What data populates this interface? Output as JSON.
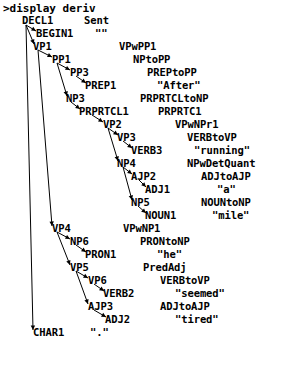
{
  "terminal": {
    "prompt_line": ">display deriv"
  },
  "derivation": {
    "header": {
      "node": "DECL1",
      "rule": "Sent"
    },
    "rows": [
      {
        "node": "DECL1",
        "node_x": 22,
        "rule": "Sent",
        "rule_x": 84,
        "y": 20,
        "depth": 0
      },
      {
        "node": "BEGIN1",
        "node_x": 36,
        "rule": "\"\"",
        "rule_x": 95,
        "y": 33,
        "depth": 1
      },
      {
        "node": "VP1",
        "node_x": 33,
        "rule": "VPwPP1",
        "rule_x": 119,
        "y": 46,
        "depth": 1
      },
      {
        "node": "PP1",
        "node_x": 52,
        "rule": "NPtoPP",
        "rule_x": 133,
        "y": 59,
        "depth": 2
      },
      {
        "node": "PP3",
        "node_x": 70,
        "rule": "PREPtoPP",
        "rule_x": 147,
        "y": 72,
        "depth": 3
      },
      {
        "node": "PREP1",
        "node_x": 85,
        "rule": "\"After\"",
        "rule_x": 157,
        "y": 85,
        "depth": 4
      },
      {
        "node": "NP3",
        "node_x": 66,
        "rule": "PRPRTCLtoNP",
        "rule_x": 140,
        "y": 98,
        "depth": 3
      },
      {
        "node": "PRPRTCL1",
        "node_x": 79,
        "rule": "PRPRTC1",
        "rule_x": 158,
        "y": 111,
        "depth": 4
      },
      {
        "node": "VP2",
        "node_x": 103,
        "rule": "VPwNPr1",
        "rule_x": 175,
        "y": 124,
        "depth": 5
      },
      {
        "node": "VP3",
        "node_x": 117,
        "rule": "VERBtoVP",
        "rule_x": 187,
        "y": 137,
        "depth": 6
      },
      {
        "node": "VERB3",
        "node_x": 131,
        "rule": "\"running\"",
        "rule_x": 194,
        "y": 150,
        "depth": 7
      },
      {
        "node": "NP4",
        "node_x": 117,
        "rule": "NPwDetQuant",
        "rule_x": 187,
        "y": 163,
        "depth": 6
      },
      {
        "node": "AJP2",
        "node_x": 131,
        "rule": "ADJtoAJP",
        "rule_x": 201,
        "y": 176,
        "depth": 7
      },
      {
        "node": "ADJ1",
        "node_x": 145,
        "rule": "\"a\"",
        "rule_x": 217,
        "y": 189,
        "depth": 8
      },
      {
        "node": "NP5",
        "node_x": 131,
        "rule": "NOUNtoNP",
        "rule_x": 201,
        "y": 202,
        "depth": 7
      },
      {
        "node": "NOUN1",
        "node_x": 145,
        "rule": "\"mile\"",
        "rule_x": 212,
        "y": 215,
        "depth": 8
      },
      {
        "node": "VP4",
        "node_x": 52,
        "rule": "VPwNP1",
        "rule_x": 123,
        "y": 228,
        "depth": 2
      },
      {
        "node": "NP6",
        "node_x": 70,
        "rule": "PRONtoNP",
        "rule_x": 140,
        "y": 241,
        "depth": 3
      },
      {
        "node": "PRON1",
        "node_x": 85,
        "rule": "\"he\"",
        "rule_x": 157,
        "y": 254,
        "depth": 4
      },
      {
        "node": "VP5",
        "node_x": 70,
        "rule": "PredAdj",
        "rule_x": 143,
        "y": 267,
        "depth": 3
      },
      {
        "node": "VP6",
        "node_x": 88,
        "rule": "VERBtoVP",
        "rule_x": 160,
        "y": 280,
        "depth": 4
      },
      {
        "node": "VERB2",
        "node_x": 103,
        "rule": "\"seemed\"",
        "rule_x": 175,
        "y": 293,
        "depth": 5
      },
      {
        "node": "AJP3",
        "node_x": 88,
        "rule": "ADJtoAJP",
        "rule_x": 160,
        "y": 306,
        "depth": 4
      },
      {
        "node": "ADJ2",
        "node_x": 105,
        "rule": "\"tired\"",
        "rule_x": 175,
        "y": 319,
        "depth": 5
      },
      {
        "node": "CHAR1",
        "node_x": 33,
        "rule": "\".\"",
        "rule_x": 90,
        "y": 332,
        "depth": 1
      }
    ],
    "edges": [
      {
        "from": "DECL1",
        "to": "BEGIN1",
        "x1": 26,
        "y1": 25,
        "x2": 36,
        "y2": 31
      },
      {
        "from": "DECL1",
        "to": "VP1",
        "x1": 26,
        "y1": 25,
        "x2": 34,
        "y2": 44
      },
      {
        "from": "DECL1",
        "to": "CHAR1",
        "x1": 26,
        "y1": 25,
        "x2": 33,
        "y2": 330
      },
      {
        "from": "VP1",
        "to": "PP1",
        "x1": 38,
        "y1": 50,
        "x2": 52,
        "y2": 57
      },
      {
        "from": "VP1",
        "to": "VP4",
        "x1": 38,
        "y1": 50,
        "x2": 52,
        "y2": 226
      },
      {
        "from": "PP1",
        "to": "PP3",
        "x1": 57,
        "y1": 63,
        "x2": 70,
        "y2": 70
      },
      {
        "from": "PP1",
        "to": "NP3",
        "x1": 57,
        "y1": 63,
        "x2": 67,
        "y2": 96
      },
      {
        "from": "PP3",
        "to": "PREP1",
        "x1": 76,
        "y1": 76,
        "x2": 86,
        "y2": 83
      },
      {
        "from": "NP3",
        "to": "PRPRTCL1",
        "x1": 71,
        "y1": 102,
        "x2": 80,
        "y2": 109
      },
      {
        "from": "PRPRTCL1",
        "to": "VP2",
        "x1": 92,
        "y1": 115,
        "x2": 103,
        "y2": 122
      },
      {
        "from": "VP2",
        "to": "VP3",
        "x1": 108,
        "y1": 128,
        "x2": 118,
        "y2": 135
      },
      {
        "from": "VP2",
        "to": "NP4",
        "x1": 108,
        "y1": 128,
        "x2": 118,
        "y2": 161
      },
      {
        "from": "VP3",
        "to": "VERB3",
        "x1": 123,
        "y1": 141,
        "x2": 132,
        "y2": 148
      },
      {
        "from": "NP4",
        "to": "AJP2",
        "x1": 123,
        "y1": 167,
        "x2": 132,
        "y2": 174
      },
      {
        "from": "NP4",
        "to": "NP5",
        "x1": 123,
        "y1": 167,
        "x2": 132,
        "y2": 200
      },
      {
        "from": "AJP2",
        "to": "ADJ1",
        "x1": 139,
        "y1": 180,
        "x2": 146,
        "y2": 187
      },
      {
        "from": "NP5",
        "to": "NOUN1",
        "x1": 138,
        "y1": 206,
        "x2": 146,
        "y2": 213
      },
      {
        "from": "VP4",
        "to": "NP6",
        "x1": 57,
        "y1": 232,
        "x2": 70,
        "y2": 239
      },
      {
        "from": "VP4",
        "to": "VP5",
        "x1": 57,
        "y1": 232,
        "x2": 70,
        "y2": 265
      },
      {
        "from": "NP6",
        "to": "PRON1",
        "x1": 76,
        "y1": 245,
        "x2": 86,
        "y2": 252
      },
      {
        "from": "VP5",
        "to": "VP6",
        "x1": 76,
        "y1": 271,
        "x2": 88,
        "y2": 278
      },
      {
        "from": "VP5",
        "to": "AJP3",
        "x1": 76,
        "y1": 271,
        "x2": 88,
        "y2": 304
      },
      {
        "from": "VP6",
        "to": "VERB2",
        "x1": 94,
        "y1": 284,
        "x2": 104,
        "y2": 291
      },
      {
        "from": "AJP3",
        "to": "ADJ2",
        "x1": 94,
        "y1": 310,
        "x2": 106,
        "y2": 317
      }
    ]
  }
}
